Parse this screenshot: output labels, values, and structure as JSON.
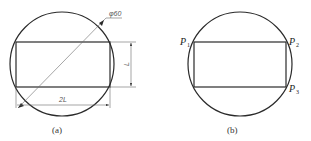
{
  "figure_a": {
    "caption": "(a)",
    "diameter_label": "φ60",
    "height_label": "L",
    "width_label": "2L",
    "circle": {
      "cx": 62,
      "cy": 64,
      "r": 52
    },
    "rect": {
      "x": 16,
      "y": 42,
      "w": 94,
      "h": 45
    }
  },
  "figure_b": {
    "caption": "(b)",
    "points": [
      {
        "label": "P",
        "sub": "1"
      },
      {
        "label": "P",
        "sub": "2"
      },
      {
        "label": "P",
        "sub": "3"
      }
    ],
    "circle": {
      "cx": 240,
      "cy": 64,
      "r": 52
    },
    "rect": {
      "x": 194,
      "y": 42,
      "w": 92,
      "h": 45
    }
  },
  "colors": {
    "line": "#2a2a2a",
    "dim_line": "#6a6a6a",
    "background": "#ffffff"
  }
}
